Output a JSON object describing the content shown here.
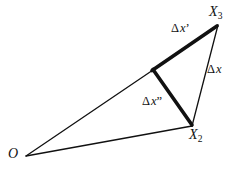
{
  "figure": {
    "type": "geometric-diagram",
    "background_color": "#ffffff",
    "stroke_color": "#111111",
    "width": 239,
    "height": 172,
    "vertices": [
      {
        "id": "O",
        "x": 26,
        "y": 156,
        "label": "O"
      },
      {
        "id": "X2",
        "x": 192,
        "y": 126,
        "label": "X",
        "subscript": "2"
      },
      {
        "id": "X3",
        "x": 218,
        "y": 25,
        "label": "X",
        "subscript": "3"
      },
      {
        "id": "P",
        "x": 153,
        "y": 70,
        "label": ""
      }
    ],
    "segments": [
      {
        "id": "o-to-p",
        "from": "O",
        "to": "P",
        "weight": "thin",
        "stroke_width": 1.3
      },
      {
        "id": "p-to-x3",
        "from": "P",
        "to": "X3",
        "weight": "thick",
        "stroke_width": 3.6,
        "label": "dxprime"
      },
      {
        "id": "p-to-x2",
        "from": "P",
        "to": "X2",
        "weight": "thick",
        "stroke_width": 3.6,
        "label": "dxdoubleprime"
      },
      {
        "id": "x3-to-x2",
        "from": "X3",
        "to": "X2",
        "weight": "thin",
        "stroke_width": 1.3,
        "label": "dx"
      },
      {
        "id": "o-to-x2",
        "from": "O",
        "to": "X2",
        "weight": "thin",
        "stroke_width": 1.3
      }
    ],
    "labels": {
      "x3": {
        "base": "X",
        "sub": "3"
      },
      "x2": {
        "base": "X",
        "sub": "2"
      },
      "origin": "O",
      "dxprime": {
        "delta": "Δ",
        "base": "x",
        "prime": "’"
      },
      "dx": {
        "delta": "Δ",
        "base": "x",
        "prime": ""
      },
      "dxdoubleprime": {
        "delta": "Δ",
        "base": "x",
        "prime": "”"
      }
    }
  }
}
